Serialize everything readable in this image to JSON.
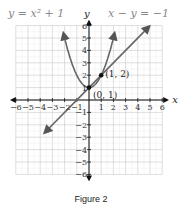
{
  "chart_data": {
    "type": "line",
    "title": "",
    "caption": "Figure 2",
    "xlabel": "x",
    "ylabel": "y",
    "xlim": [
      -6,
      6
    ],
    "ylim": [
      -6,
      6
    ],
    "grid": true,
    "x_ticks": [
      -6,
      -5,
      -4,
      -3,
      -2,
      -1,
      1,
      2,
      3,
      4,
      5,
      6
    ],
    "y_ticks": [
      6,
      5,
      4,
      3,
      2,
      1,
      -1,
      -2,
      -3,
      -4,
      -5,
      -6
    ],
    "series": [
      {
        "name": "y = x^2 + 1",
        "label": "y = x² + 1",
        "kind": "parabola",
        "color": "#666666",
        "x_range": [
          -2,
          2
        ]
      },
      {
        "name": "x - y = -1",
        "label": "x − y = −1",
        "kind": "line",
        "color": "#666666",
        "x_range": [
          -3.5,
          4.8
        ]
      }
    ],
    "points": [
      {
        "label": "(0, 1)",
        "x": 0,
        "y": 1
      },
      {
        "label": "(1, 2)",
        "x": 1,
        "y": 2
      }
    ]
  }
}
